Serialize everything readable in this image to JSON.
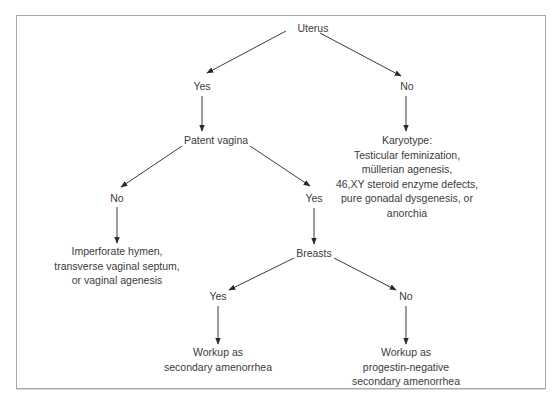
{
  "diagram": {
    "type": "decision-tree",
    "root": "Uterus",
    "nodes": {
      "uterus": {
        "label": "Uterus"
      },
      "uterus_yes": {
        "label": "Yes"
      },
      "uterus_no": {
        "label": "No"
      },
      "patent_vagina": {
        "label": "Patent vagina"
      },
      "karyotype": {
        "lines": [
          "Karyotype:",
          "Testicular feminization,",
          "müllerian agenesis,",
          "46,XY steroid enzyme defects,",
          "pure gonadal dysgenesis, or",
          "anorchia"
        ]
      },
      "vagina_no": {
        "label": "No"
      },
      "vagina_yes": {
        "label": "Yes"
      },
      "obstruction": {
        "lines": [
          "Imperforate hymen,",
          "transverse vaginal septum,",
          "or vaginal agenesis"
        ]
      },
      "breasts": {
        "label": "Breasts"
      },
      "breasts_yes": {
        "label": "Yes"
      },
      "breasts_no": {
        "label": "No"
      },
      "workup_secondary": {
        "lines": [
          "Workup as",
          "secondary amenorrhea"
        ]
      },
      "workup_progestin_negative": {
        "lines": [
          "Workup as",
          "progestin-negative",
          "secondary amenorrhea"
        ]
      }
    },
    "edges": [
      [
        "uterus",
        "uterus_yes"
      ],
      [
        "uterus",
        "uterus_no"
      ],
      [
        "uterus_yes",
        "patent_vagina"
      ],
      [
        "uterus_no",
        "karyotype"
      ],
      [
        "patent_vagina",
        "vagina_no"
      ],
      [
        "patent_vagina",
        "vagina_yes"
      ],
      [
        "vagina_no",
        "obstruction"
      ],
      [
        "vagina_yes",
        "breasts"
      ],
      [
        "breasts",
        "breasts_yes"
      ],
      [
        "breasts",
        "breasts_no"
      ],
      [
        "breasts_yes",
        "workup_secondary"
      ],
      [
        "breasts_no",
        "workup_progestin_negative"
      ]
    ]
  }
}
